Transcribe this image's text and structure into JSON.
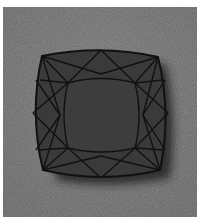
{
  "image": {
    "subject": "cushion-cut gemstone",
    "colors": {
      "page_background": "#ffffff",
      "backdrop": "#6e6e6e",
      "gem_fill": "#3a3a3a",
      "facet_lines": "#111111",
      "shadow": "#1e1e1e"
    }
  }
}
